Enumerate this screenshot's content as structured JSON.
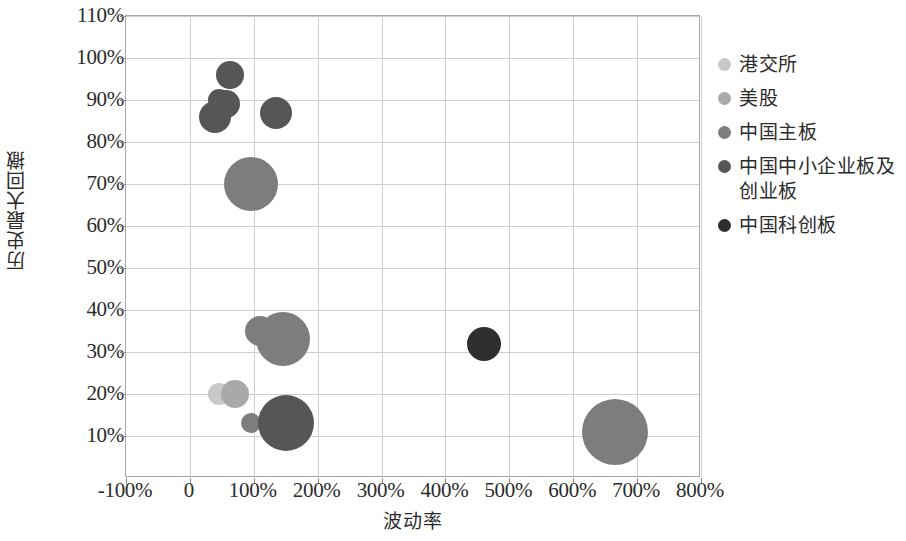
{
  "chart_data": {
    "type": "scatter",
    "title": "",
    "xlabel": "波动率",
    "ylabel": "历史最大回撤",
    "xlim": [
      -100,
      800
    ],
    "ylim": [
      0,
      110
    ],
    "xtick_labels": [
      "-100%",
      "0",
      "100%",
      "200%",
      "300%",
      "400%",
      "500%",
      "600%",
      "700%",
      "800%"
    ],
    "xtick_values": [
      -100,
      0,
      100,
      200,
      300,
      400,
      500,
      600,
      700,
      800
    ],
    "ytick_labels": [
      "10%",
      "20%",
      "30%",
      "40%",
      "50%",
      "60%",
      "70%",
      "80%",
      "90%",
      "100%",
      "110%"
    ],
    "ytick_values": [
      10,
      20,
      30,
      40,
      50,
      60,
      70,
      80,
      90,
      100,
      110
    ],
    "grid": true,
    "legend_position": "right",
    "series": [
      {
        "name": "港交所",
        "color": "#c9c9c9",
        "points": [
          {
            "x": 45,
            "y": 20,
            "r": 11
          }
        ]
      },
      {
        "name": "美股",
        "color": "#a9a9a9",
        "points": [
          {
            "x": 70,
            "y": 20,
            "r": 14
          }
        ]
      },
      {
        "name": "中国主板",
        "color": "#7d7d7d",
        "points": [
          {
            "x": 95,
            "y": 70,
            "r": 27
          },
          {
            "x": 110,
            "y": 35,
            "r": 15
          },
          {
            "x": 145,
            "y": 33,
            "r": 27
          },
          {
            "x": 95,
            "y": 13,
            "r": 10
          },
          {
            "x": 665,
            "y": 11,
            "r": 33
          }
        ]
      },
      {
        "name": "中国中小企业板及\n创业板",
        "color": "#565656",
        "points": [
          {
            "x": 45,
            "y": 90,
            "r": 11
          },
          {
            "x": 40,
            "y": 86,
            "r": 16
          },
          {
            "x": 57,
            "y": 89,
            "r": 14
          },
          {
            "x": 62,
            "y": 96,
            "r": 14
          },
          {
            "x": 135,
            "y": 87,
            "r": 16
          },
          {
            "x": 150,
            "y": 13,
            "r": 28
          }
        ]
      },
      {
        "name": "中国科创板",
        "color": "#2e2e2e",
        "points": [
          {
            "x": 460,
            "y": 32,
            "r": 17
          }
        ]
      }
    ]
  },
  "axes": {
    "x_title": "波动率",
    "y_title": "历史最大回撤"
  },
  "legend": {
    "items": [
      {
        "label": "港交所",
        "color": "#c9c9c9"
      },
      {
        "label": "美股",
        "color": "#a9a9a9"
      },
      {
        "label": "中国主板",
        "color": "#7d7d7d"
      },
      {
        "label": "中国中小企业板及\n创业板",
        "color": "#565656"
      },
      {
        "label": "中国科创板",
        "color": "#2e2e2e"
      }
    ]
  }
}
